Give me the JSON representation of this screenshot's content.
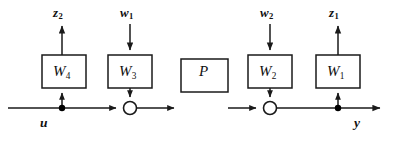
{
  "diagram": {
    "colors": {
      "background": "#ffffff",
      "stroke": "#1a1a1a",
      "box_fill": "#ffffff",
      "node_fill": "#000000",
      "junction_fill": "#ffffff"
    },
    "blocks": [
      {
        "id": "W4",
        "label": "W",
        "subscript": "4",
        "x": 42,
        "y": 55,
        "w": 44,
        "h": 33
      },
      {
        "id": "W3",
        "label": "W",
        "subscript": "3",
        "x": 108,
        "y": 55,
        "w": 44,
        "h": 33
      },
      {
        "id": "P",
        "label": "P",
        "subscript": "",
        "x": 181,
        "y": 88,
        "w": 47,
        "h": 33
      },
      {
        "id": "W2",
        "label": "W",
        "subscript": "2",
        "x": 248,
        "y": 55,
        "w": 44,
        "h": 33
      },
      {
        "id": "W1",
        "label": "W",
        "subscript": "1",
        "x": 316,
        "y": 55,
        "w": 44,
        "h": 33
      }
    ],
    "signals": {
      "z2": {
        "label": "z",
        "subscript": "2"
      },
      "w1": {
        "label": "w",
        "subscript": "1"
      },
      "w2": {
        "label": "w",
        "subscript": "2"
      },
      "z1": {
        "label": "z",
        "subscript": "1"
      },
      "u": {
        "label": "u",
        "subscript": ""
      },
      "y": {
        "label": "y",
        "subscript": ""
      }
    },
    "junctions": [
      {
        "id": "sum-1",
        "type": "summing-circle",
        "cx": 130,
        "cy": 108,
        "r": 6.5
      },
      {
        "id": "sum-2",
        "type": "summing-circle",
        "cx": 270,
        "cy": 108,
        "r": 6.5
      }
    ],
    "nodes": [
      {
        "id": "node-u",
        "type": "branch-dot",
        "cx": 62,
        "cy": 108,
        "r": 3.1
      },
      {
        "id": "node-y",
        "type": "branch-dot",
        "cx": 338,
        "cy": 108,
        "r": 3.1
      }
    ],
    "main_line": {
      "y": 108,
      "x_start": 8,
      "x_end": 386
    }
  }
}
